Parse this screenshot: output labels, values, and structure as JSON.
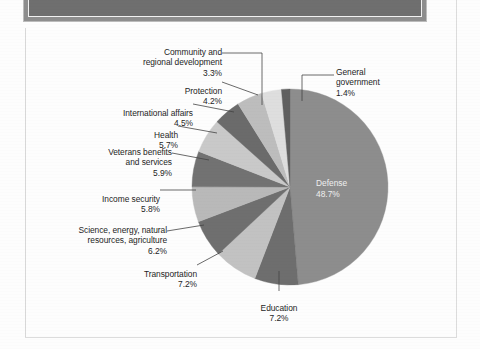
{
  "document": {
    "header_band": "",
    "figure_background": "#fdfdfd"
  },
  "chart_data": {
    "type": "pie",
    "title": "",
    "subtitle": "",
    "xlabel": "",
    "ylabel": "",
    "legend_position": "labels-with-leader-lines",
    "grid": false,
    "units": "percent",
    "total": 100.0,
    "start_angle_deg": 0,
    "direction": "clockwise",
    "center": {
      "x": 264,
      "y": 158
    },
    "radius": 98,
    "categories": [
      "Defense",
      "Education",
      "Transportation",
      "Science, energy, natural resources, agriculture",
      "Income security",
      "Veterans benefits and services",
      "Health",
      "International affairs",
      "Protection",
      "Community and regional development",
      "General government"
    ],
    "values": [
      48.7,
      7.2,
      7.2,
      6.2,
      5.8,
      5.9,
      5.7,
      4.5,
      4.2,
      3.3,
      1.4
    ],
    "colors": [
      "#8d8d8d",
      "#6e6e6e",
      "#c2c2c2",
      "#6f6f6f",
      "#b9b9b9",
      "#727272",
      "#c9c9c9",
      "#6b6b6b",
      "#bdbdbd",
      "#dedede",
      "#5f5f5f"
    ],
    "slices": [
      {
        "label": "Defense",
        "value": 48.7,
        "percent_text": "48.7%",
        "color": "#8d8d8d",
        "label_placement": "inside",
        "label_color": "#f0f0f0"
      },
      {
        "label": "Education",
        "value": 7.2,
        "percent_text": "7.2%",
        "color": "#6e6e6e",
        "label_placement": "outside"
      },
      {
        "label": "Transportation",
        "value": 7.2,
        "percent_text": "7.2%",
        "color": "#c2c2c2",
        "label_placement": "outside"
      },
      {
        "label": "Science, energy, natural resources, agriculture",
        "value": 6.2,
        "percent_text": "6.2%",
        "color": "#6f6f6f",
        "label_placement": "outside"
      },
      {
        "label": "Income security",
        "value": 5.8,
        "percent_text": "5.8%",
        "color": "#b9b9b9",
        "label_placement": "outside"
      },
      {
        "label": "Veterans benefits and services",
        "value": 5.9,
        "percent_text": "5.9%",
        "color": "#727272",
        "label_placement": "outside"
      },
      {
        "label": "Health",
        "value": 5.7,
        "percent_text": "5.7%",
        "color": "#c9c9c9",
        "label_placement": "outside"
      },
      {
        "label": "International affairs",
        "value": 4.5,
        "percent_text": "4.5%",
        "color": "#6b6b6b",
        "label_placement": "outside"
      },
      {
        "label": "Protection",
        "value": 4.2,
        "percent_text": "4.2%",
        "color": "#bdbdbd",
        "label_placement": "outside"
      },
      {
        "label": "Community and regional development",
        "value": 3.3,
        "percent_text": "3.3%",
        "color": "#dedede",
        "label_placement": "outside"
      },
      {
        "label": "General government",
        "value": 1.4,
        "percent_text": "1.4%",
        "color": "#5f5f5f",
        "label_placement": "outside"
      }
    ]
  },
  "labels": {
    "defense": {
      "name": "Defense",
      "pct": "48.7%"
    },
    "education": {
      "name": "Education",
      "pct": "7.2%"
    },
    "transportation": {
      "name": "Transportation",
      "pct": "7.2%"
    },
    "science": {
      "name": "Science, energy, natural\nresources, agriculture",
      "pct": "6.2%"
    },
    "income_security": {
      "name": "Income security",
      "pct": "5.8%"
    },
    "veterans": {
      "name": "Veterans benefits\nand services",
      "pct": "5.9%"
    },
    "health": {
      "name": "Health",
      "pct": "5.7%"
    },
    "international": {
      "name": "International affairs",
      "pct": "4.5%"
    },
    "protection": {
      "name": "Protection",
      "pct": "4.2%"
    },
    "community": {
      "name": "Community and\nregional development",
      "pct": "3.3%"
    },
    "general_government": {
      "name": "General\ngovernment",
      "pct": "1.4%"
    }
  }
}
